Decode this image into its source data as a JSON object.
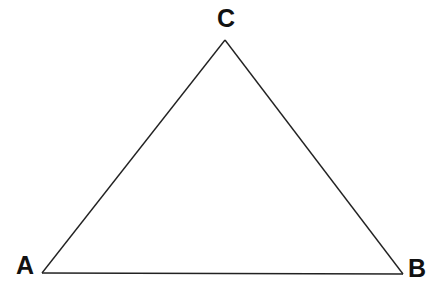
{
  "diagram": {
    "type": "triangle",
    "stroke_color": "#222222",
    "vertices": [
      {
        "id": "A",
        "label": "A",
        "x": 42,
        "y": 273
      },
      {
        "id": "B",
        "label": "B",
        "x": 403,
        "y": 274
      },
      {
        "id": "C",
        "label": "C",
        "x": 225,
        "y": 40
      }
    ],
    "labels": {
      "A": "A",
      "B": "B",
      "C": "C"
    }
  }
}
